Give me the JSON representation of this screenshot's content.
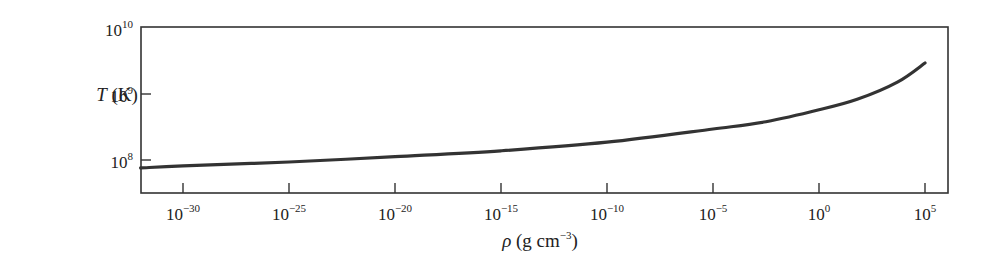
{
  "chart_data": {
    "type": "line",
    "title": "",
    "xlabel": "ρ (g cm⁻³)",
    "ylabel": "T (K)",
    "xlabel_parts": {
      "symbol": "ρ",
      "unit_pre": " (g cm",
      "unit_exp": "−3",
      "unit_post": ")"
    },
    "ylabel_parts": {
      "symbol": "T",
      "unit": " (K)"
    },
    "x_scale": "log",
    "y_scale": "log",
    "xlim_log10": [
      -32,
      6
    ],
    "ylim_log10": [
      7.5,
      10
    ],
    "grid": false,
    "legend": null,
    "x_ticks": [
      {
        "base": "10",
        "exp": "−30",
        "log10": -30
      },
      {
        "base": "10",
        "exp": "−25",
        "log10": -25
      },
      {
        "base": "10",
        "exp": "−20",
        "log10": -20
      },
      {
        "base": "10",
        "exp": "−15",
        "log10": -15
      },
      {
        "base": "10",
        "exp": "−10",
        "log10": -10
      },
      {
        "base": "10",
        "exp": "−5",
        "log10": -5
      },
      {
        "base": "10",
        "exp": "0",
        "log10": 0
      },
      {
        "base": "10",
        "exp": "5",
        "log10": 5
      }
    ],
    "y_ticks": [
      {
        "base": "10",
        "exp": "8",
        "log10": 8
      },
      {
        "base": "10",
        "exp": "9",
        "log10": 9
      },
      {
        "base": "10",
        "exp": "10",
        "log10": 10
      }
    ],
    "series": [
      {
        "name": "T(ρ)",
        "color": "#333333",
        "log10_x": [
          -32,
          -30,
          -25,
          -20,
          -15,
          -10,
          -5,
          -2.5,
          0,
          1.8,
          3.7,
          5
        ],
        "log10_y": [
          7.88,
          7.91,
          7.97,
          8.05,
          8.14,
          8.27,
          8.47,
          8.58,
          8.76,
          8.92,
          9.18,
          9.47
        ]
      }
    ]
  },
  "colors": {
    "axis": "#333333",
    "line": "#333333",
    "text": "#222222",
    "background": "#ffffff"
  }
}
